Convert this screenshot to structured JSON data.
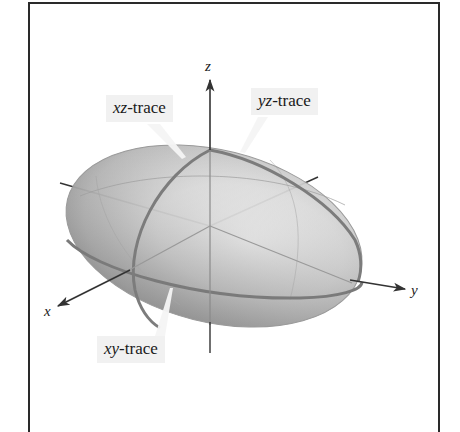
{
  "figure": {
    "axes": {
      "x_label": "x",
      "y_label": "y",
      "z_label": "z"
    },
    "labels": {
      "xz_trace": {
        "var": "xz",
        "suffix": "-trace"
      },
      "yz_trace": {
        "var": "yz",
        "suffix": "-trace"
      },
      "xy_trace": {
        "var": "xy",
        "suffix": "-trace"
      }
    },
    "colors": {
      "frame": "#2a2a2a",
      "axis": "#333333",
      "surface_light": "#f4f4f4",
      "surface_dark": "#8a8a8a",
      "trace": "#7a7a7a",
      "label_bg": "#f1f1f1"
    }
  }
}
